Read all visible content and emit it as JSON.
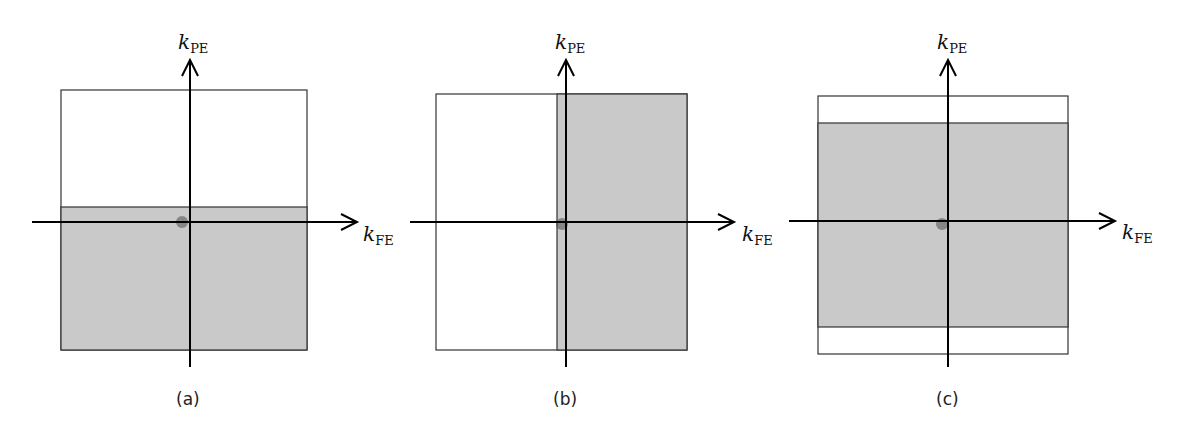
{
  "figure": {
    "axis_symbol": "k",
    "vertical_axis_sub": "PE",
    "horizontal_axis_sub": "FE",
    "fill_color": "#c9c9c9",
    "panels": [
      {
        "caption": "(a)",
        "sampled_region": "lower half plus small band above center (partial Fourier in PE)"
      },
      {
        "caption": "(b)",
        "sampled_region": "right half plus small band left of center (partial Fourier in FE)"
      },
      {
        "caption": "(c)",
        "sampled_region": "central band in PE, top and bottom unsampled"
      }
    ]
  }
}
